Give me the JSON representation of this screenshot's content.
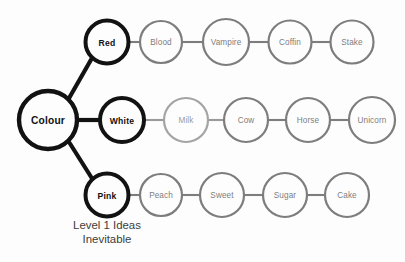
{
  "diagram": {
    "background_color": "#fdfdfd",
    "root": {
      "label": "Colour",
      "cx": 48,
      "cy": 120,
      "r": 29,
      "style": "root",
      "stroke_color": "#121212",
      "text_color": "#111111"
    },
    "branches": [
      {
        "name": "red-branch",
        "primary": {
          "label": "Red",
          "cx": 107,
          "cy": 42,
          "r": 21.5,
          "style": "primary",
          "stroke_color": "#121212",
          "text_color": "#111111"
        },
        "chain": [
          {
            "label": "Blood",
            "cx": 161,
            "cy": 42,
            "r": 21.0,
            "style": "chain",
            "stroke_color": "#7d7d7d",
            "text_color": "#7e7e7e"
          },
          {
            "label": "Vampire",
            "cx": 226,
            "cy": 42,
            "r": 23.0,
            "style": "chain",
            "stroke_color": "#7d7d7d",
            "text_color": "#7e7e7e"
          },
          {
            "label": "Coffin",
            "cx": 290,
            "cy": 42,
            "r": 21.5,
            "style": "chain",
            "stroke_color": "#7d7d7d",
            "text_color": "#7e7e7e"
          },
          {
            "label": "Stake",
            "cx": 352,
            "cy": 42,
            "r": 21.5,
            "style": "chain",
            "stroke_color": "#7d7d7d",
            "text_color": "#7e7e7e"
          }
        ]
      },
      {
        "name": "white-branch",
        "primary": {
          "label": "White",
          "cx": 122,
          "cy": 120,
          "r": 22.0,
          "style": "primary",
          "stroke_color": "#121212",
          "text_color": "#111111"
        },
        "chain": [
          {
            "label": "Milk",
            "cx": 186,
            "cy": 120,
            "r": 22.0,
            "style": "chain-light",
            "stroke_color": "#a4a4a4",
            "text_color": "#9b9b9b"
          },
          {
            "label": "Cow",
            "cx": 246,
            "cy": 120,
            "r": 22.0,
            "style": "chain",
            "stroke_color": "#7d7d7d",
            "text_color": "#7e7e7e"
          },
          {
            "label": "Horse",
            "cx": 308,
            "cy": 120,
            "r": 22.0,
            "style": "chain",
            "stroke_color": "#7d7d7d",
            "text_color": "#7e7e7e"
          },
          {
            "label": "Unicorn",
            "cx": 372,
            "cy": 120,
            "r": 23.0,
            "style": "chain",
            "stroke_color": "#7d7d7d",
            "text_color": "#7e7e7e"
          }
        ]
      },
      {
        "name": "pink-branch",
        "primary": {
          "label": "Pink",
          "cx": 107,
          "cy": 195,
          "r": 21.5,
          "style": "primary",
          "stroke_color": "#121212",
          "text_color": "#111111"
        },
        "chain": [
          {
            "label": "Peach",
            "cx": 161,
            "cy": 195,
            "r": 21.0,
            "style": "chain",
            "stroke_color": "#7d7d7d",
            "text_color": "#7e7e7e"
          },
          {
            "label": "Sweet",
            "cx": 222,
            "cy": 195,
            "r": 22.0,
            "style": "chain",
            "stroke_color": "#7d7d7d",
            "text_color": "#7e7e7e"
          },
          {
            "label": "Sugar",
            "cx": 285,
            "cy": 195,
            "r": 22.0,
            "style": "chain",
            "stroke_color": "#7d7d7d",
            "text_color": "#7e7e7e"
          },
          {
            "label": "Cake",
            "cx": 347,
            "cy": 195,
            "r": 22.0,
            "style": "chain",
            "stroke_color": "#7d7d7d",
            "text_color": "#7e7e7e"
          }
        ]
      }
    ],
    "caption": {
      "line1": "Level 1 Ideas",
      "line2": "Inevitable",
      "text_color": "#3c3c3c"
    }
  },
  "_label_overrides": {
    "red_chain_3": "Stake",
    "red_chain_4": "Coffin"
  }
}
